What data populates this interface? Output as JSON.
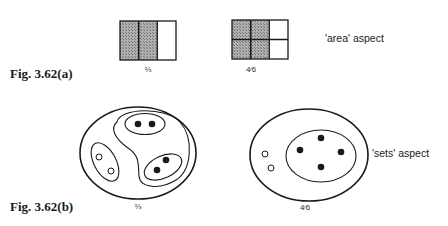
{
  "figure_a": {
    "label": "Fig. 3.62(a)",
    "aspect_label": "'area' aspect",
    "diagram_left": {
      "fraction": "⅔",
      "columns": 3,
      "rows": 1,
      "shaded": 2
    },
    "diagram_right": {
      "fraction": "4⁄6",
      "columns": 3,
      "rows": 2,
      "shaded": 4
    }
  },
  "figure_b": {
    "label": "Fig. 3.62(b)",
    "aspect_label": "'sets' aspect",
    "diagram_left": {
      "fraction": "⅔",
      "groups": 3,
      "filled_dots": 4,
      "hollow_dots": 2
    },
    "diagram_right": {
      "fraction": "4⁄6",
      "filled_dots": 4,
      "hollow_dots": 2
    }
  },
  "colors": {
    "ink": "#1a1a1a",
    "shade": "#9a9a9a",
    "background": "#ffffff"
  }
}
